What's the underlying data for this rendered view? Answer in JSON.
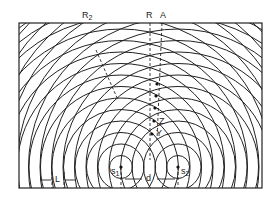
{
  "figure": {
    "frame": {
      "x": 19,
      "y": 23,
      "w": 243,
      "h": 165
    },
    "sources": [
      {
        "id": "s1",
        "label": "s",
        "sub": "1",
        "x": 121,
        "y": 167
      },
      {
        "id": "s2",
        "label": "s",
        "sub": "2",
        "x": 178,
        "y": 167
      }
    ],
    "wavelength_px": 11.5,
    "ring_count": 22,
    "lines": {
      "R": {
        "label": "R"
      },
      "A": {
        "label": "A"
      },
      "R2": {
        "label": "R",
        "sub": "2"
      }
    },
    "points": {
      "Z": {
        "label": "Z"
      },
      "Y": {
        "label": "Y"
      }
    },
    "dimensions": {
      "L": {
        "label": "L"
      },
      "d": {
        "label": "d"
      }
    },
    "colors": {
      "ink": "#222222",
      "background": "#ffffff"
    }
  }
}
